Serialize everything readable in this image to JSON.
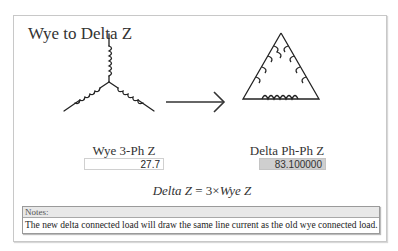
{
  "title": "Wye to Delta Z",
  "wye": {
    "label": "Wye 3-Ph Z",
    "value": "27.7"
  },
  "delta": {
    "label": "Delta Ph-Ph Z",
    "value": "83.100000"
  },
  "formula": {
    "lhs": "Delta Z",
    "eq": " = 3×",
    "rhs": "Wye Z"
  },
  "notes": {
    "header": "Notes:",
    "text": "The new delta connected load will draw the same line current as the old wye connected load."
  },
  "icons": {
    "wye": "wye-circuit-icon",
    "arrow": "right-arrow-icon",
    "delta": "delta-circuit-icon"
  }
}
